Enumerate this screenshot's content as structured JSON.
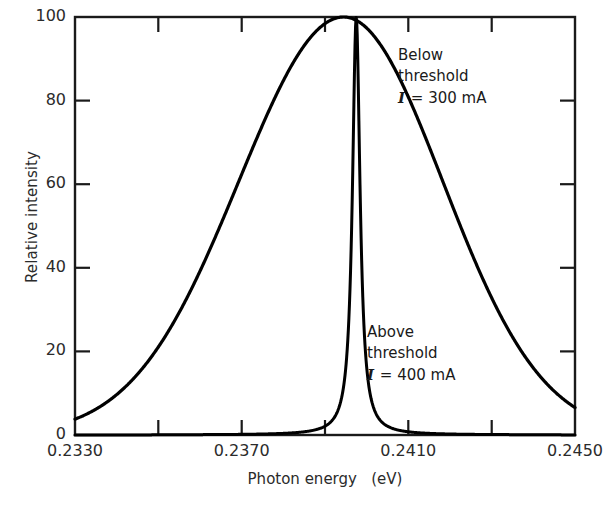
{
  "chart_data": {
    "type": "line",
    "title": "",
    "xlabel": "Photon energy   (eV)",
    "ylabel": "Relative intensity",
    "xlim": [
      0.233,
      0.245
    ],
    "ylim": [
      0,
      100
    ],
    "grid": false,
    "legend_position": "inline-annotations",
    "x_ticks_major": [
      "0.2330",
      "0.2370",
      "0.2410",
      "0.2450"
    ],
    "x_ticks_major_values": [
      0.233,
      0.237,
      0.241,
      0.245
    ],
    "x_ticks_minor_values": [
      0.235,
      0.239,
      0.243
    ],
    "y_ticks": [
      "0",
      "20",
      "40",
      "60",
      "80",
      "100"
    ],
    "y_tick_values": [
      0,
      20,
      40,
      60,
      80,
      100
    ],
    "series": [
      {
        "name": "Below threshold I = 300 mA",
        "peak_center": 0.23945,
        "peak_height": 100,
        "fwhm": 0.0056,
        "shape": "broad-gaussian",
        "x": [
          0.233,
          0.234,
          0.235,
          0.2356,
          0.2362,
          0.2368,
          0.2374,
          0.238,
          0.2386,
          0.2392,
          0.23945,
          0.2398,
          0.2404,
          0.241,
          0.2416,
          0.2422,
          0.2428,
          0.2434,
          0.244,
          0.2446,
          0.245
        ],
        "values": [
          0.3,
          1.1,
          3.4,
          6.0,
          11.0,
          19.0,
          31.0,
          48.0,
          70.0,
          93.0,
          100.0,
          95.0,
          79.0,
          59.0,
          41.0,
          27.0,
          17.0,
          10.0,
          5.5,
          2.4,
          1.2
        ]
      },
      {
        "name": "Above threshold I = 400 mA",
        "peak_center": 0.23975,
        "peak_height": 100,
        "fwhm": 0.00022,
        "shape": "narrow-lorentzian-spike",
        "x": [
          0.2392,
          0.2394,
          0.23955,
          0.23965,
          0.23972,
          0.23975,
          0.23979,
          0.23986,
          0.23996,
          0.2401,
          0.2403
        ],
        "values": [
          0.0,
          0.4,
          2.0,
          10.0,
          55.0,
          100.0,
          55.0,
          10.0,
          2.0,
          0.4,
          0.0
        ]
      }
    ],
    "annotations": [
      {
        "id": "below",
        "line1": "Below",
        "line2": "threshold",
        "symbol": "I",
        "equals_value": "= 300 mA",
        "x": 0.2412,
        "y": 88
      },
      {
        "id": "above",
        "line1": "Above",
        "line2": "threshold",
        "symbol": "I",
        "equals_value": "= 400 mA",
        "x": 0.2405,
        "y": 27
      }
    ],
    "colors": {
      "curve": "#000000",
      "axis": "#1a1a1a",
      "background": "#ffffff",
      "text": "#1a1a1a"
    }
  },
  "axes": {
    "y_title": "Relative intensity",
    "x_title": "Photon energy   (eV)",
    "y_tick_labels": [
      "100",
      "80",
      "60",
      "40",
      "20",
      "0"
    ],
    "x_tick_labels": [
      "0.2330",
      "0.2370",
      "0.2410",
      "0.2450"
    ]
  },
  "annotations": {
    "below": {
      "line1": "Below",
      "line2": "threshold",
      "symbol": "I",
      "value": "= 300 mA"
    },
    "above": {
      "line1": "Above",
      "line2": "threshold",
      "symbol": "I",
      "value": "= 400 mA"
    }
  }
}
